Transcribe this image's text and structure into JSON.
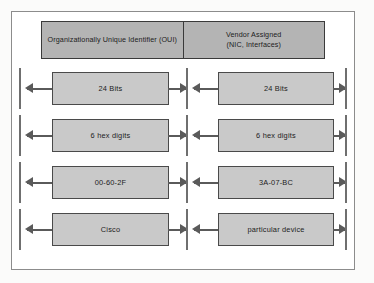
{
  "diagram": {
    "colors": {
      "header_fill": "#b4b4b4",
      "header_border": "#3a3a3a",
      "box_fill": "#c9c9c9",
      "box_border": "#4a4a4a",
      "arrow": "#5a5a5a",
      "tick": "#6f6f6f",
      "frame": "#8c8c8c",
      "page_background": "#fbfbfa"
    },
    "headers": [
      {
        "line1": "Organizationally Unique Identifier (OUI)",
        "line2": ""
      },
      {
        "line1": "Vendor Assigned",
        "line2": "(NIC, Interfaces)"
      }
    ],
    "rows": [
      {
        "left": "24 Bits",
        "right": "24 Bits"
      },
      {
        "left": "6 hex digits",
        "right": "6 hex digits"
      },
      {
        "left": "00-60-2F",
        "right": "3A-07-BC"
      },
      {
        "left": "Cisco",
        "right": "particular device"
      }
    ]
  }
}
